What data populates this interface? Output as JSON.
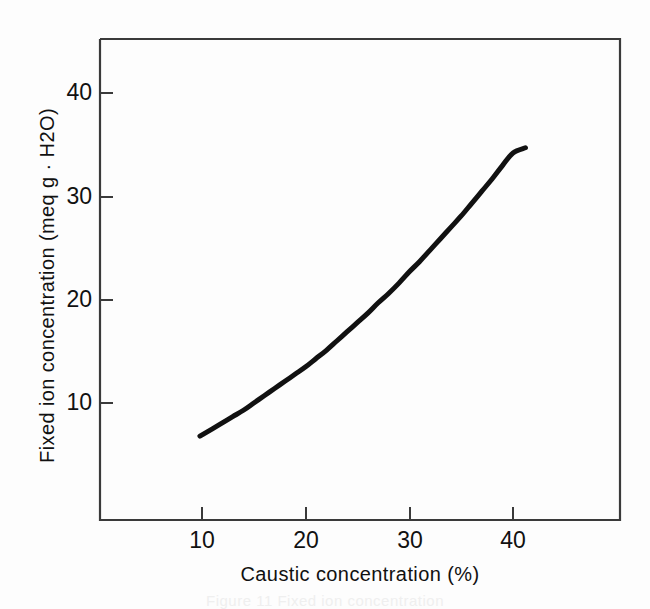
{
  "figure": {
    "background_color": "#fdfdfd",
    "axis_color": "#3a3a3a",
    "curve_color": "#111111",
    "caption": "Figure 11  Fixed ion concentration"
  },
  "chart_data": {
    "type": "line",
    "title": "",
    "subtitle": "",
    "xlabel": "Caustic concentration  (%)",
    "ylabel": "Fixed ion concentration  (meq g · H2O)",
    "xlim": [
      0,
      50
    ],
    "ylim": [
      0,
      46.5
    ],
    "xticks": [
      10,
      20,
      30,
      40
    ],
    "xtick_labels": [
      "10",
      "20",
      "30",
      "40"
    ],
    "yticks": [
      10,
      20,
      30,
      40
    ],
    "ytick_labels": [
      "10",
      "20",
      "30",
      "40"
    ],
    "grid": false,
    "legend": false,
    "legend_position": "none",
    "series": [
      {
        "name": "Fixed ion concentration",
        "x": [
          9.8,
          11,
          12,
          13,
          14,
          15,
          16,
          17,
          18,
          19,
          20,
          21,
          22,
          23,
          24,
          25,
          26,
          27,
          28,
          29,
          30,
          31,
          32,
          33,
          34,
          35,
          36,
          37,
          38,
          39,
          40,
          41.2
        ],
        "y": [
          6.8,
          7.5,
          8.1,
          8.7,
          9.3,
          10.0,
          10.7,
          11.4,
          12.1,
          12.8,
          13.5,
          14.3,
          15.1,
          16.0,
          16.9,
          17.8,
          18.7,
          19.7,
          20.6,
          21.6,
          22.7,
          23.7,
          24.8,
          25.9,
          27.0,
          28.1,
          29.3,
          30.5,
          31.7,
          33.0,
          34.2,
          34.7
        ]
      }
    ]
  },
  "axis_titles": {
    "y": "Fixed ion concentration  (meq g · H2O)",
    "x": "Caustic concentration  (%)"
  },
  "tick_labels": {
    "y": [
      "10",
      "20",
      "30",
      "40"
    ],
    "x": [
      "10",
      "20",
      "30",
      "40"
    ]
  }
}
